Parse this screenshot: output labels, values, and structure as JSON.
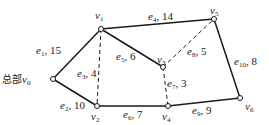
{
  "diagram": {
    "type": "weighted-graph",
    "colors": {
      "line": "#1a1a1a",
      "node_fill": "#ffffff",
      "text": "#222222"
    },
    "headquarters_label": "总部",
    "nodes": [
      {
        "id": "v0",
        "base": "v",
        "sub": "0",
        "x": 53,
        "y": 79,
        "label_x": 34,
        "label_y": 83,
        "prefix": "总部"
      },
      {
        "id": "v1",
        "base": "v",
        "sub": "1",
        "x": 101,
        "y": 29,
        "label_x": 95,
        "label_y": 19
      },
      {
        "id": "v2",
        "base": "v",
        "sub": "2",
        "x": 97,
        "y": 106,
        "label_x": 91,
        "label_y": 120
      },
      {
        "id": "v3",
        "base": "v",
        "sub": "3",
        "x": 163,
        "y": 67,
        "label_x": 157,
        "label_y": 63
      },
      {
        "id": "v4",
        "base": "v",
        "sub": "4",
        "x": 168,
        "y": 106,
        "label_x": 162,
        "label_y": 120
      },
      {
        "id": "v5",
        "base": "v",
        "sub": "5",
        "x": 214,
        "y": 19,
        "label_x": 210,
        "label_y": 14
      },
      {
        "id": "v6",
        "base": "v",
        "sub": "6",
        "x": 240,
        "y": 98,
        "label_x": 245,
        "label_y": 110
      }
    ],
    "edges": [
      {
        "id": "e1",
        "from": "v0",
        "to": "v1",
        "weight": "15",
        "style": "solid",
        "label_x": 36,
        "label_y": 54
      },
      {
        "id": "e2",
        "from": "v0",
        "to": "v2",
        "weight": "10",
        "style": "solid",
        "label_x": 60,
        "label_y": 109
      },
      {
        "id": "e3",
        "from": "v1",
        "to": "v2",
        "weight": "4",
        "style": "dashed",
        "label_x": 77,
        "label_y": 77
      },
      {
        "id": "e4",
        "from": "v1",
        "to": "v5",
        "weight": "14",
        "style": "solid",
        "label_x": 148,
        "label_y": 20
      },
      {
        "id": "e5",
        "from": "v1",
        "to": "v3",
        "weight": "6",
        "style": "solid",
        "label_x": 116,
        "label_y": 60
      },
      {
        "id": "e6",
        "from": "v2",
        "to": "v4",
        "weight": "7",
        "style": "solid",
        "label_x": 123,
        "label_y": 118
      },
      {
        "id": "e7",
        "from": "v3",
        "to": "v4",
        "weight": "3",
        "style": "dashed",
        "label_x": 167,
        "label_y": 87
      },
      {
        "id": "e8",
        "from": "v3",
        "to": "v5",
        "weight": "5",
        "style": "dashed",
        "label_x": 187,
        "label_y": 55
      },
      {
        "id": "e9",
        "from": "v4",
        "to": "v6",
        "weight": "9",
        "style": "solid",
        "label_x": 192,
        "label_y": 114
      },
      {
        "id": "e10",
        "from": "v5",
        "to": "v6",
        "weight": "8",
        "style": "solid",
        "label_x": 234,
        "label_y": 65
      }
    ]
  }
}
